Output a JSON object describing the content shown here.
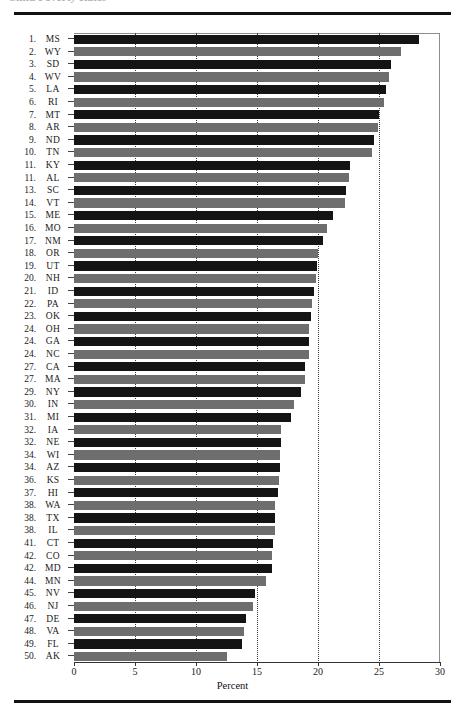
{
  "header": {
    "clipped_title": "Child Poverty Rates"
  },
  "chart_data": {
    "type": "bar",
    "orientation": "horizontal",
    "title": "",
    "xlabel": "Percent",
    "ylabel": "",
    "xlim": [
      0,
      30
    ],
    "xticks": [
      0,
      5,
      10,
      15,
      20,
      25,
      30
    ],
    "gridlines": [
      5,
      10,
      15,
      20,
      25
    ],
    "grid": true,
    "legend": null,
    "bar_colors": [
      "#141414",
      "#6e6e6e"
    ],
    "categories": [
      "MS",
      "WY",
      "SD",
      "WV",
      "LA",
      "RI",
      "MT",
      "AR",
      "ND",
      "TN",
      "KY",
      "AL",
      "SC",
      "VT",
      "ME",
      "MO",
      "NM",
      "OR",
      "UT",
      "NH",
      "ID",
      "PA",
      "OK",
      "OH",
      "GA",
      "NC",
      "CA",
      "MA",
      "NY",
      "IN",
      "MI",
      "IA",
      "NE",
      "WI",
      "AZ",
      "KS",
      "HI",
      "WA",
      "TX",
      "IL",
      "CT",
      "CO",
      "MD",
      "MN",
      "NV",
      "NJ",
      "DE",
      "VA",
      "FL",
      "AK"
    ],
    "values": [
      28.3,
      26.8,
      26.0,
      25.8,
      25.6,
      25.4,
      25.0,
      24.9,
      24.6,
      24.4,
      22.6,
      22.5,
      22.3,
      22.2,
      21.2,
      20.7,
      20.4,
      20.0,
      19.9,
      19.8,
      19.7,
      19.5,
      19.4,
      19.3,
      19.3,
      19.3,
      18.9,
      18.9,
      18.6,
      18.0,
      17.8,
      17.0,
      17.0,
      16.9,
      16.9,
      16.8,
      16.7,
      16.5,
      16.5,
      16.5,
      16.3,
      16.2,
      16.2,
      15.7,
      14.8,
      14.7,
      14.1,
      13.9,
      13.8,
      12.5
    ],
    "ranks": [
      "1.",
      "2.",
      "3.",
      "4.",
      "5.",
      "6.",
      "7.",
      "8.",
      "9.",
      "10.",
      "11.",
      "11.",
      "13.",
      "14.",
      "15.",
      "16.",
      "17.",
      "18.",
      "19.",
      "20.",
      "21.",
      "22.",
      "23.",
      "24.",
      "24.",
      "24.",
      "27.",
      "27.",
      "29.",
      "30.",
      "31.",
      "32.",
      "32.",
      "34.",
      "34.",
      "36.",
      "37.",
      "38.",
      "38.",
      "38.",
      "41.",
      "42.",
      "42.",
      "44.",
      "45.",
      "46.",
      "47.",
      "48.",
      "49.",
      "50."
    ]
  }
}
